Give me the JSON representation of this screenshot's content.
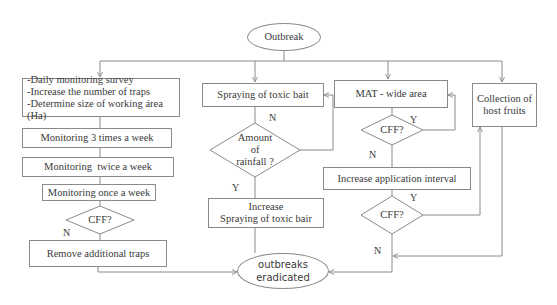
{
  "diagram": {
    "start": "Outbreak",
    "end": [
      "outbreaks",
      "eradicated"
    ],
    "left_branch": {
      "actions": [
        "-Daily monitoring survey",
        "-Increase the number of traps",
        "-Determine size of working área (Ha)"
      ],
      "monitor_3x": "Monitoring 3 times a week",
      "monitor_2x": "Monitoring  twice a week",
      "monitor_1x": "Monitoring once a week",
      "decision": "CFF?",
      "decision_no": "N",
      "remove": "Remove additional traps"
    },
    "bait_branch": {
      "spraying": "Spraying of toxic bait",
      "decision": [
        "Amount",
        "of",
        "rainfall ?"
      ],
      "decision_no": "N",
      "decision_yes": "Y",
      "increase": [
        "Increase",
        "Spraying of toxic bair"
      ]
    },
    "mat_branch": {
      "mat": "MAT - wide area",
      "decision1": "CFF?",
      "decision1_yes": "Y",
      "decision1_no": "N",
      "interval": "Increase application interval",
      "decision2": "CFF?",
      "decision2_yes": "Y",
      "decision2_no": "N"
    },
    "host_branch": {
      "collection": [
        "Collection of",
        "host fruits"
      ]
    }
  },
  "colors": {
    "line": "#8a8a8a",
    "text": "#3a3a3a",
    "background": "#ffffff"
  }
}
